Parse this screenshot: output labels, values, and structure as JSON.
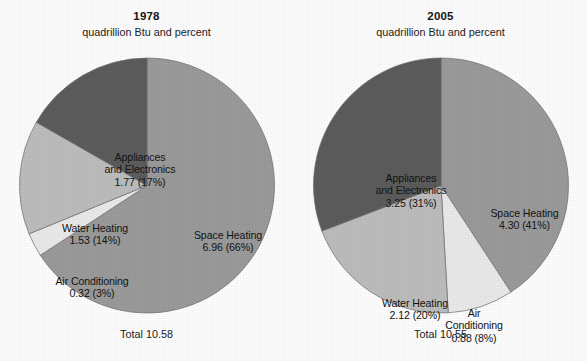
{
  "figure": {
    "background_color": "#fefefe",
    "text_color": "#141414"
  },
  "colors": {
    "space_heating": "#9b9b9b",
    "appliances_and_electronics": "#5c5c5c",
    "water_heating": "#bdbdbd",
    "air_conditioning": "#eaeaea",
    "slice_outline": "#6e6e6e"
  },
  "panels": [
    {
      "id": "1978",
      "title": "1978",
      "subtitle": "quadrillion Btu and percent",
      "total_label": "Total 10.58",
      "labels": {
        "space_heating": {
          "line1": "Space Heating",
          "line2": "6.96 (66%)"
        },
        "appliances": {
          "line1": "Appliances",
          "line2": "and Electronics",
          "line3": "1.77 (17%)"
        },
        "water_heating": {
          "line1": "Water Heating",
          "line2": "1.53 (14%)"
        },
        "air_conditioning": {
          "line1": "Air Conditioning",
          "line2": "0.32 (3%)"
        }
      }
    },
    {
      "id": "2005",
      "title": "2005",
      "subtitle": "quadrillion Btu and percent",
      "total_label": "Total 10.55",
      "labels": {
        "space_heating": {
          "line1": "Space Heating",
          "line2": "4.30 (41%)"
        },
        "appliances": {
          "line1": "Appliances",
          "line2": "and Electronics",
          "line3": "3.25 (31%)"
        },
        "water_heating": {
          "line1": "Water Heating",
          "line2": "2.12 (20%)"
        },
        "air_conditioning": {
          "line1": "Air",
          "line2": "Conditioning",
          "line3": "0.88 (8%)"
        }
      }
    }
  ],
  "chart_data": [
    {
      "type": "pie",
      "title": "1978",
      "subtitle": "quadrillion Btu and percent",
      "unit": "quadrillion Btu",
      "total": 10.58,
      "total_label": "Total 10.58",
      "start_angle_deg": 0,
      "direction": "clockwise",
      "legend": "none (labels on slices)",
      "categories": [
        "Space Heating",
        "Air Conditioning",
        "Water Heating",
        "Appliances and Electronics"
      ],
      "values": [
        6.96,
        0.32,
        1.53,
        1.77
      ],
      "percents": [
        66,
        3,
        14,
        17
      ],
      "colors": [
        "#9b9b9b",
        "#eaeaea",
        "#bdbdbd",
        "#5c5c5c"
      ],
      "data_labels": [
        "6.96 (66%)",
        "0.32 (3%)",
        "1.53 (14%)",
        "1.77 (17%)"
      ]
    },
    {
      "type": "pie",
      "title": "2005",
      "subtitle": "quadrillion Btu and percent",
      "unit": "quadrillion Btu",
      "total": 10.55,
      "total_label": "Total 10.55",
      "start_angle_deg": 0,
      "direction": "clockwise",
      "legend": "none (labels on slices)",
      "categories": [
        "Space Heating",
        "Air Conditioning",
        "Water Heating",
        "Appliances and Electronics"
      ],
      "values": [
        4.3,
        0.88,
        2.12,
        3.25
      ],
      "percents": [
        41,
        8,
        20,
        31
      ],
      "colors": [
        "#9b9b9b",
        "#eaeaea",
        "#bdbdbd",
        "#5c5c5c"
      ],
      "data_labels": [
        "4.30 (41%)",
        "0.88 (8%)",
        "2.12 (20%)",
        "3.25 (31%)"
      ]
    }
  ]
}
